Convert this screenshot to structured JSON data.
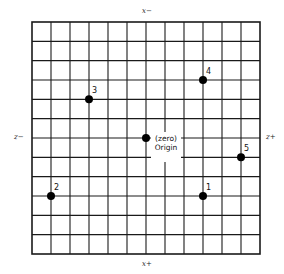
{
  "figure": {
    "type": "coordinate-grid",
    "grid": {
      "columns": 12,
      "rows": 12,
      "left": 32,
      "top": 22,
      "right": 260,
      "bottom": 254,
      "line_color": "#1a1a1a",
      "border_width": 1.6,
      "line_width": 1.1
    },
    "axis_labels": {
      "top": "x−",
      "bottom": "x+",
      "left": "z−",
      "right": "z+"
    },
    "origin": {
      "col": 6,
      "row": 6,
      "line1": "(zero)",
      "line2": "Origin"
    },
    "points": [
      {
        "label": "1",
        "col": 9,
        "row": 9
      },
      {
        "label": "2",
        "col": 1,
        "row": 9
      },
      {
        "label": "3",
        "col": 3,
        "row": 4
      },
      {
        "label": "4",
        "col": 9,
        "row": 3
      },
      {
        "label": "5",
        "col": 11,
        "row": 7
      }
    ],
    "point_color": "#000000",
    "point_radius": 4
  }
}
